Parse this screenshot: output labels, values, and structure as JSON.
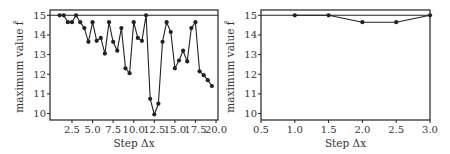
{
  "chart_data": [
    {
      "type": "line",
      "panel": "left",
      "title": "",
      "xlabel": "Step Δx",
      "ylabel": "maximum value f̂",
      "xlim": [
        -0.17,
        20.24
      ],
      "ylim": [
        9.67,
        15.27
      ],
      "xticks": [
        2.5,
        5.0,
        7.5,
        10.0,
        12.5,
        15.0,
        17.5,
        20.0
      ],
      "xtick_labels": [
        "2.5",
        "5.0",
        "7.5",
        "10.0",
        "12.5",
        "15.0",
        "17.5",
        "20.0"
      ],
      "yticks": [
        10,
        11,
        12,
        13,
        14,
        15
      ],
      "ytick_labels": [
        "10",
        "11",
        "12",
        "13",
        "14",
        "15"
      ],
      "reference_line": 15.0,
      "grid": false,
      "legend": null,
      "x": [
        1.0,
        1.5,
        2.0,
        2.5,
        3.0,
        3.5,
        4.0,
        4.5,
        5.0,
        5.5,
        6.0,
        6.5,
        7.0,
        7.5,
        8.0,
        8.5,
        9.0,
        9.5,
        10.0,
        10.5,
        11.0,
        11.5,
        12.0,
        12.5,
        13.0,
        13.5,
        14.0,
        14.5,
        15.0,
        15.5,
        16.0,
        16.5,
        17.0,
        17.5,
        18.0,
        18.5,
        19.0,
        19.5
      ],
      "series": [
        {
          "name": "maximum value",
          "color": "#222222",
          "values": [
            15.0,
            15.0,
            14.65,
            14.65,
            15.0,
            14.65,
            14.35,
            13.65,
            14.65,
            13.7,
            13.85,
            13.05,
            14.65,
            13.65,
            13.2,
            14.35,
            12.3,
            12.05,
            14.65,
            13.85,
            13.7,
            15.0,
            10.75,
            9.95,
            10.5,
            13.65,
            14.65,
            14.15,
            12.3,
            12.7,
            13.2,
            12.65,
            14.35,
            14.65,
            12.15,
            11.95,
            11.7,
            11.4
          ]
        }
      ]
    },
    {
      "type": "line",
      "panel": "right",
      "title": "",
      "xlabel": "Step Δx",
      "ylabel": "maximum value f̂",
      "xlim": [
        0.5,
        3.0
      ],
      "ylim": [
        9.67,
        15.27
      ],
      "xticks": [
        0.5,
        1.0,
        1.5,
        2.0,
        2.5,
        3.0
      ],
      "xtick_labels": [
        "0.5",
        "1.0",
        "1.5",
        "2.0",
        "2.5",
        "3.0"
      ],
      "yticks": [
        10,
        11,
        12,
        13,
        14,
        15
      ],
      "ytick_labels": [
        "10",
        "11",
        "12",
        "13",
        "14",
        "15"
      ],
      "reference_line": 15.0,
      "grid": false,
      "legend": null,
      "x": [
        1.0,
        1.5,
        2.0,
        2.5,
        3.0
      ],
      "series": [
        {
          "name": "maximum value",
          "color": "#222222",
          "values": [
            15.0,
            15.0,
            14.65,
            14.65,
            15.0
          ]
        }
      ]
    }
  ],
  "panels": {
    "left": {
      "box": {
        "x0": 50,
        "x1": 218,
        "y0": 10,
        "y1": 120
      }
    },
    "right": {
      "box": {
        "x0": 261,
        "x1": 430,
        "y0": 10,
        "y1": 120
      }
    }
  },
  "colors": {
    "line": "#222222",
    "axes": "#222222",
    "text": "#333333"
  }
}
